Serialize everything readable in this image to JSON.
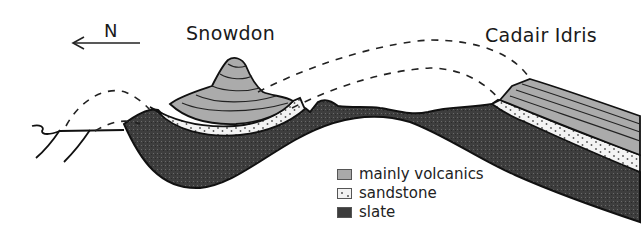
{
  "diagram": {
    "type": "geological-cross-section",
    "direction_label": "N",
    "direction_arrow": "left",
    "peaks": [
      {
        "name": "Snowdon"
      },
      {
        "name": "Cadair Idris"
      }
    ],
    "legend": [
      {
        "label": "mainly volcanics",
        "pattern": "light-grey-banded",
        "color": "#a9a9a9"
      },
      {
        "label": "sandstone",
        "pattern": "dotted",
        "color": "#f2f2f2"
      },
      {
        "label": "slate",
        "pattern": "dark-stipple",
        "color": "#3c3c3c"
      }
    ],
    "annotations": {
      "dashed_lines": "eroded former extent of folded strata (anticline arc between Snowdon and Cadair Idris)"
    }
  }
}
